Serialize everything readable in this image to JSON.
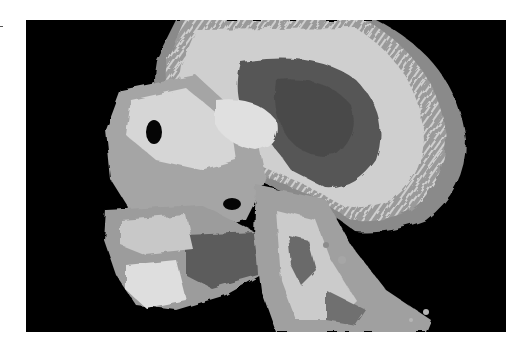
{
  "figure": {
    "background": "#000000",
    "page_background": "#ffffff",
    "palette": {
      "outer_soft_tissue": "#8a8a8a",
      "bone_bright": "#d4d4d4",
      "bone_mid": "#a9a9a9",
      "cavity_dark": "#555555",
      "shadow": "#3a3a3a"
    },
    "frame": {
      "x": 26,
      "y": 20,
      "width": 480,
      "height": 312
    }
  }
}
